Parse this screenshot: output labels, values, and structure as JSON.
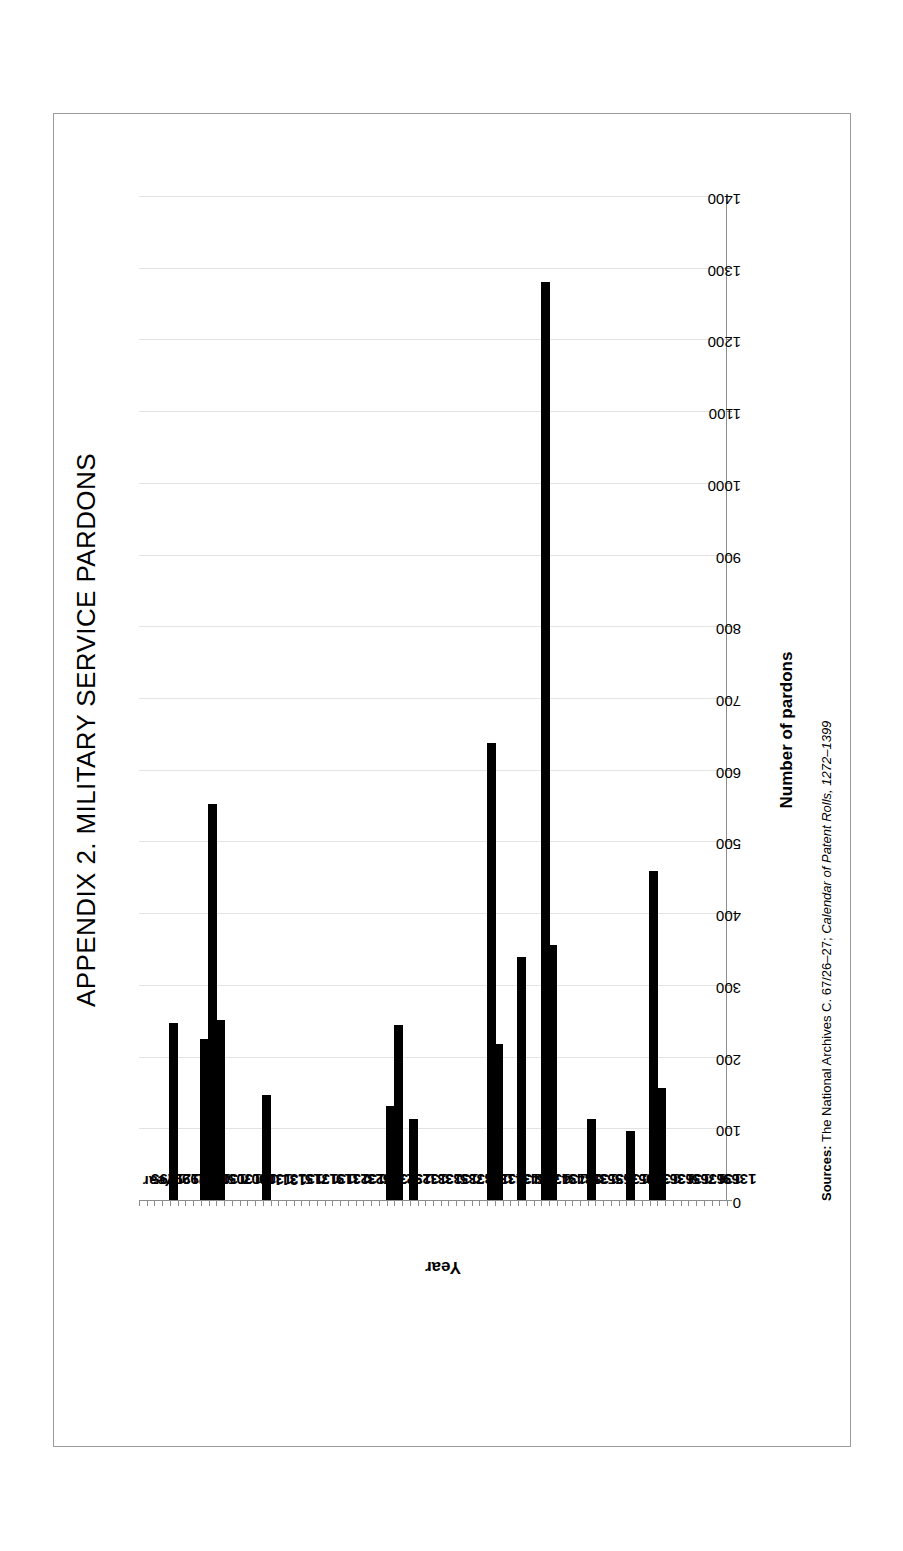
{
  "page": {
    "background": "#ffffff",
    "border_color": "#9a9a9a"
  },
  "title": "APPENDIX 2.  MILITARY SERVICE PARDONS",
  "source": {
    "label": "Sources:",
    "archive": " The National Archives C. 67/26–27;",
    "publication": " Calendar of Patent Rolls,",
    "range": " 1272–1399"
  },
  "chart_data": {
    "type": "bar",
    "orientation": "horizontal-on-page",
    "title": "APPENDIX 2.  MILITARY SERVICE PARDONS",
    "xlabel": "Year",
    "ylabel": "Number of pardons",
    "ylim": [
      0,
      1400
    ],
    "ytick_step": 100,
    "yticks": [
      0,
      100,
      200,
      300,
      400,
      500,
      600,
      700,
      800,
      900,
      1000,
      1100,
      1200,
      1300,
      1400
    ],
    "ytick_labels": [
      "0",
      "100",
      "200",
      "300",
      "400",
      "500",
      "600",
      "700",
      "800",
      "900",
      "1000",
      "1100",
      "1200",
      "1300",
      "1400"
    ],
    "grid": true,
    "grid_color": "#e3e3e3",
    "bar_color": "#000000",
    "legend": null,
    "first_category_label": "Year",
    "category_label_interval": 2,
    "categories": [
      "Year",
      "1295",
      "1296",
      "1297",
      "1298",
      "1299",
      "1300",
      "1301",
      "1302",
      "1303",
      "1304",
      "1305",
      "1306",
      "1307",
      "1308",
      "1309",
      "1310",
      "1311",
      "1312",
      "1313",
      "1314",
      "1315",
      "1316",
      "1317",
      "1318",
      "1319",
      "1320",
      "1321",
      "1322",
      "1323",
      "1324",
      "1325",
      "1326",
      "1327",
      "1328",
      "1329",
      "1330",
      "1331",
      "1332",
      "1333",
      "1334",
      "1335",
      "1336",
      "1337",
      "1338",
      "1339",
      "1340",
      "1341",
      "1342",
      "1343",
      "1344",
      "1345",
      "1346",
      "1347",
      "1348",
      "1349",
      "1350",
      "1351",
      "1352",
      "1353",
      "1354",
      "1355",
      "1356",
      "1357",
      "1358",
      "1359",
      "1360",
      "1361",
      "1362",
      "1363",
      "1364",
      "1365",
      "1366",
      "1367",
      "1368",
      "1369"
    ],
    "values": [
      0,
      0,
      0,
      0,
      248,
      0,
      0,
      0,
      226,
      554,
      252,
      0,
      0,
      0,
      0,
      0,
      148,
      0,
      0,
      0,
      0,
      0,
      0,
      0,
      0,
      0,
      0,
      0,
      0,
      0,
      0,
      0,
      133,
      245,
      0,
      114,
      0,
      0,
      0,
      0,
      0,
      0,
      0,
      0,
      0,
      638,
      219,
      0,
      0,
      340,
      0,
      0,
      1281,
      357,
      0,
      0,
      0,
      0,
      114,
      0,
      0,
      0,
      0,
      98,
      0,
      0,
      460,
      157,
      0,
      0,
      0,
      0,
      0,
      0,
      0,
      0
    ],
    "displayed_tick_labels": [
      "Year",
      "1295",
      "1297",
      "1299",
      "1301",
      "1303",
      "1305",
      "1307",
      "1309",
      "1311",
      "1313",
      "1315",
      "1317",
      "1319",
      "1321",
      "1323",
      "1325",
      "1327",
      "1329",
      "1331",
      "1333",
      "1335",
      "1337",
      "1339",
      "1341",
      "1343",
      "1345",
      "1347",
      "1349",
      "1351",
      "1353",
      "1355",
      "1357",
      "1359",
      "1361",
      "1363",
      "1365",
      "1367",
      "1369"
    ]
  }
}
